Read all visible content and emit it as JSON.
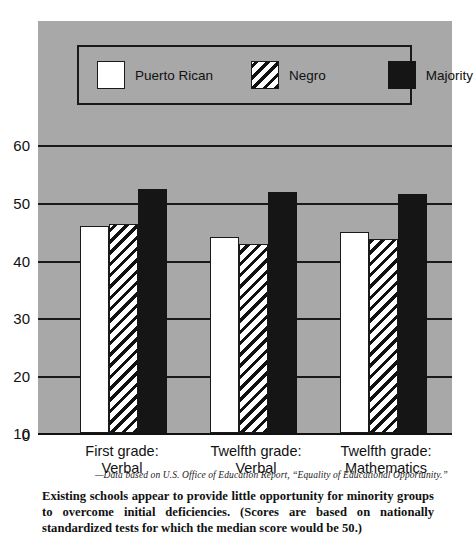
{
  "chart_data": {
    "type": "bar",
    "title": "",
    "subtitle": "",
    "xlabel": "",
    "ylabel": "",
    "ylim": [
      0,
      65
    ],
    "yticks": [
      0,
      10,
      20,
      30,
      40,
      50,
      60
    ],
    "ytick_labels": [
      "0",
      "10",
      "20",
      "30",
      "40",
      "50",
      "60"
    ],
    "grid": true,
    "grid_axis": "y",
    "legend_position": "top-inside",
    "categories": [
      "First grade: Verbal",
      "Twelfth grade: Verbal",
      "Twelfth grade: Mathematics"
    ],
    "category_lines": [
      [
        "First grade:",
        "Verbal"
      ],
      [
        "Twelfth grade:",
        "Verbal"
      ],
      [
        "Twelfth grade:",
        "Mathematics"
      ]
    ],
    "series": [
      {
        "name": "Puerto Rican",
        "fill": "white",
        "color": "#ffffff",
        "values": [
          45.0,
          42.7,
          43.7
        ]
      },
      {
        "name": "Negro",
        "fill": "diagonal-hatch",
        "color": "#111111",
        "values": [
          45.5,
          41.0,
          42.2
        ]
      },
      {
        "name": "Majority",
        "fill": "solid",
        "color": "#151515",
        "values": [
          53.0,
          52.5,
          52.0
        ]
      }
    ],
    "source_note": "—Data based on U.S. Office of Education Report, “Equality of Educational Opportunity.”",
    "caption": "Existing schools appear to provide little opportunity for minority groups to overcome initial deficiencies. (Scores are based on nationally standardized tests for which the median score would be 50.)",
    "panel_background": "#a8a8a8",
    "median_reference": 50
  }
}
